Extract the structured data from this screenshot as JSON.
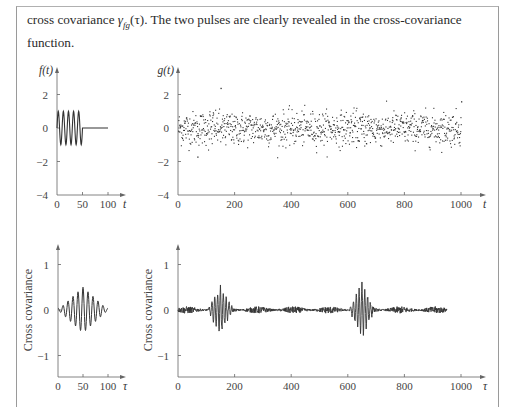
{
  "caption": {
    "line1_pre": "cross covariance ",
    "gamma": "γ",
    "subscript": "fg",
    "arg": "(τ)",
    "line1_post": ". The two pulses are clearly revealed in the cross-covariance",
    "line2": "function."
  },
  "chart_data": [
    {
      "id": "f_t",
      "type": "line",
      "title": "",
      "ylabel": "f(t)",
      "xlabel": "t",
      "xlim": [
        0,
        110
      ],
      "ylim": [
        -4,
        3
      ],
      "xticks": [
        0,
        50,
        100
      ],
      "yticks": [
        2,
        0,
        -2,
        -4
      ],
      "ytick_labels": [
        "2",
        "0",
        "−2",
        "−4"
      ],
      "description": "Sinusoidal pulse: 5 cycles of amplitude 1 over t=0..50, then 0 until t=100",
      "pulse": {
        "start": 0,
        "end": 50,
        "cycles": 5,
        "amplitude": 1,
        "zero_until": 100
      }
    },
    {
      "id": "g_t",
      "type": "scatter",
      "ylabel": "g(t)",
      "xlabel": "t",
      "xlim": [
        0,
        1050
      ],
      "ylim": [
        -4,
        3
      ],
      "xticks": [
        0,
        200,
        400,
        600,
        800,
        1000
      ],
      "yticks": [
        2,
        0,
        -2,
        -4
      ],
      "ytick_labels": [
        "2",
        "0",
        "−2",
        "−4"
      ],
      "description": "1000 noisy samples around 0 (std ≈ 0.5) containing two hidden pulses near t≈150 and t≈650",
      "n_points": 1000,
      "noise_std": 0.5,
      "outliers": [
        {
          "x": 150,
          "y": 2.4
        },
        {
          "x": 68,
          "y": -1.7
        },
        {
          "x": 1000,
          "y": 1.6
        }
      ]
    },
    {
      "id": "autocov_f",
      "type": "line",
      "ylabel": "Cross covariance",
      "xlabel": "τ",
      "xlim": [
        0,
        110
      ],
      "ylim": [
        -1.5,
        1.5
      ],
      "xticks": [
        0,
        50,
        100
      ],
      "yticks": [
        1,
        0,
        -1
      ],
      "ytick_labels": [
        "1",
        "0",
        "−1"
      ],
      "description": "Triangular-envelope oscillation centered at τ=50, peak ≈ 0.5, min ≈ −0.45, spans τ=0..100",
      "center": 50,
      "half_width": 50,
      "peak": 0.5,
      "cycles_per_unit": 0.1
    },
    {
      "id": "crosscov_fg",
      "type": "line",
      "ylabel": "Cross covariance",
      "xlabel": "τ",
      "xlim": [
        0,
        1050
      ],
      "ylim": [
        -1.5,
        1.5
      ],
      "xticks": [
        0,
        200,
        400,
        600,
        800,
        1000
      ],
      "yticks": [
        1,
        0,
        -1
      ],
      "ytick_labels": [
        "1",
        "0",
        "−1"
      ],
      "description": "Cross covariance of f and g: two pulses centered at τ≈150 and τ≈650 (peak ≈ 0.5–0.55), low-amplitude noise elsewhere, trace ends at τ≈950",
      "pulses": [
        {
          "center": 150,
          "half_width": 45,
          "peak": 0.5
        },
        {
          "center": 650,
          "half_width": 45,
          "peak": 0.55
        }
      ],
      "end": 950,
      "noise_amp": 0.05
    }
  ],
  "axes_labels": {
    "f": "f(t)",
    "g": "g(t)",
    "t": "t",
    "tau": "τ",
    "cc": "Cross covariance"
  }
}
